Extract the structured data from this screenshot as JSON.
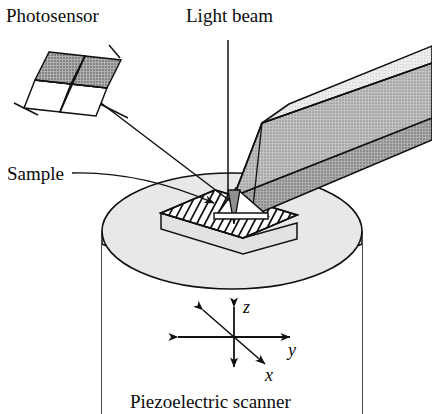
{
  "figure": {
    "caption": "Piezoelectric scanner",
    "background_color": "#ffffff"
  },
  "labels": {
    "photosensor": "Photosensor",
    "light_beam": "Light beam",
    "sample": "Sample",
    "caption": "Piezoelectric scanner"
  },
  "axes": {
    "z": "z",
    "y": "y",
    "x": "x"
  },
  "colors": {
    "line": "#111111",
    "cantilever_top": "#b4b4b4",
    "cantilever_side": "#9e9e9e",
    "cantilever_end": "#8f8f8f",
    "photosensor_shaded": "#9a9a9a",
    "photosensor_clear": "#ffffff",
    "scanner_top": "#e6e6e6",
    "scanner_body": "#ffffff",
    "sample_top": "#ffffff",
    "sample_side": "#d8d8d8",
    "tip": "#8a8a8a"
  },
  "parts": {
    "photosensor": "quadrant photodetector",
    "cantilever": "cantilever-probe-beam",
    "tip": "probe-tip",
    "sample": "hatched-sample-slab",
    "scanner": "piezoelectric-scanner-cylinder",
    "beam": "reflected-laser-beam",
    "incident_beam": "incident-light-beam"
  }
}
